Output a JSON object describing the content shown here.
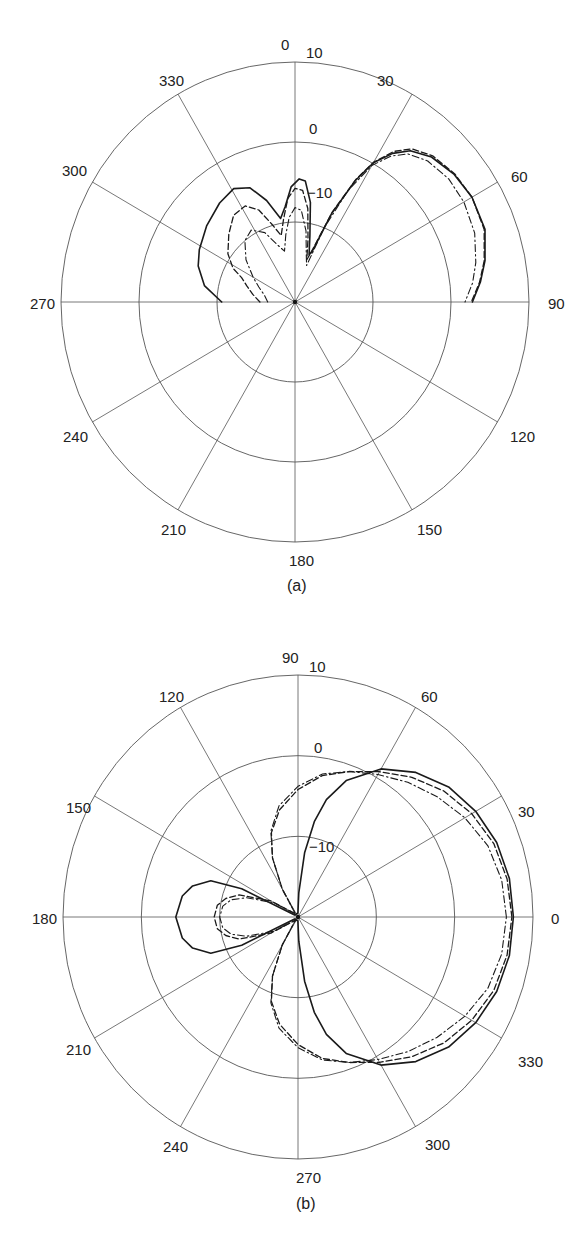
{
  "chart_data": [
    {
      "type": "polar",
      "panel": "a",
      "caption": "(a)",
      "center": [
        295,
        302
      ],
      "radius_px": [
        234,
        240
      ],
      "angle_zero": "top",
      "angle_direction": "clockwise",
      "angle_ticks": [
        0,
        30,
        60,
        90,
        120,
        150,
        180,
        210,
        240,
        270,
        300,
        330
      ],
      "angle_labels": [
        "0",
        "30",
        "60",
        "90",
        "120",
        "150",
        "180",
        "210",
        "240",
        "270",
        "300",
        "330"
      ],
      "radial_ticks_db": [
        -10,
        0,
        10
      ],
      "radial_labels": [
        "−10",
        "0",
        "10"
      ],
      "rlim_db": [
        -20,
        10
      ],
      "grid": true,
      "series": [
        {
          "name": "solid",
          "style": "solid",
          "points": [
            [
              270,
              -10.6
            ],
            [
              280,
              -8.2
            ],
            [
              290,
              -6.8
            ],
            [
              298,
              -6.1
            ],
            [
              310,
              -5.2
            ],
            [
              322,
              -4.3
            ],
            [
              331,
              -3.8
            ],
            [
              338,
              -4.6
            ],
            [
              344,
              -6.8
            ],
            [
              350,
              -9.4
            ],
            [
              354,
              -8
            ],
            [
              358,
              -5.6
            ],
            [
              2,
              -4.6
            ],
            [
              5,
              -4.8
            ],
            [
              9,
              -7.4
            ],
            [
              13,
              -11.5
            ],
            [
              17,
              -13.8
            ],
            [
              19,
              -13.4
            ],
            [
              23,
              -8
            ],
            [
              27,
              -3
            ],
            [
              30,
              0.1
            ],
            [
              34,
              2.4
            ],
            [
              38,
              4.0
            ],
            [
              44,
              5.2
            ],
            [
              52,
              5.9
            ],
            [
              60,
              6.2
            ],
            [
              69.5,
              6.0
            ],
            [
              78,
              4.9
            ],
            [
              84,
              3.9
            ],
            [
              90,
              2.75
            ]
          ]
        },
        {
          "name": "dashed",
          "style": "dashed",
          "points": [
            [
              270,
              -15.5
            ],
            [
              280,
              -14.5
            ],
            [
              288,
              -13.5
            ],
            [
              294,
              -12.5
            ],
            [
              298,
              -11
            ],
            [
              305,
              -9.5
            ],
            [
              315,
              -8
            ],
            [
              324,
              -6.6
            ],
            [
              332,
              -6.4
            ],
            [
              338,
              -7.6
            ],
            [
              343,
              -9.8
            ],
            [
              348,
              -11.5
            ],
            [
              352,
              -9.5
            ],
            [
              356,
              -7
            ],
            [
              0,
              -5.8
            ],
            [
              4,
              -6
            ],
            [
              8,
              -8.2
            ],
            [
              12,
              -12
            ],
            [
              16,
              -14.5
            ],
            [
              19,
              -13
            ],
            [
              23,
              -7.8
            ],
            [
              27,
              -2.8
            ],
            [
              30,
              0.2
            ],
            [
              34,
              2.7
            ],
            [
              38,
              4.3
            ],
            [
              44,
              5.4
            ],
            [
              52,
              6.0
            ],
            [
              60,
              6.2
            ],
            [
              69.5,
              5.9
            ],
            [
              78,
              4.8
            ],
            [
              84,
              3.8
            ],
            [
              90,
              2.6
            ]
          ]
        },
        {
          "name": "dash-dot",
          "style": "dashdot",
          "points": [
            [
              270,
              -16.5
            ],
            [
              282,
              -16
            ],
            [
              292,
              -15
            ],
            [
              300,
              -13.8
            ],
            [
              310,
              -11.8
            ],
            [
              320,
              -10
            ],
            [
              328,
              -9.4
            ],
            [
              336,
              -10.5
            ],
            [
              342,
              -12.4
            ],
            [
              348,
              -13.5
            ],
            [
              352,
              -11.5
            ],
            [
              356,
              -9.4
            ],
            [
              0,
              -8.2
            ],
            [
              4,
              -8.5
            ],
            [
              9,
              -11
            ],
            [
              14,
              -14
            ],
            [
              18,
              -15.2
            ],
            [
              22,
              -10
            ],
            [
              26,
              -4.5
            ],
            [
              30,
              -0.3
            ],
            [
              34,
              2.0
            ],
            [
              38,
              3.5
            ],
            [
              44,
              4.5
            ],
            [
              52,
              5.0
            ],
            [
              60,
              5.0
            ],
            [
              69.5,
              4.6
            ],
            [
              78,
              3.7
            ],
            [
              84,
              2.9
            ],
            [
              90,
              1.8
            ]
          ]
        }
      ]
    },
    {
      "type": "polar",
      "panel": "b",
      "caption": "(b)",
      "center": [
        298,
        917
      ],
      "radius_px": [
        235,
        242
      ],
      "angle_zero": "right",
      "angle_direction": "counterclockwise",
      "angle_ticks": [
        0,
        30,
        60,
        90,
        120,
        150,
        180,
        210,
        240,
        270,
        300,
        330
      ],
      "angle_labels": [
        "0",
        "30",
        "60",
        "90",
        "120",
        "150",
        "180",
        "210",
        "240",
        "270",
        "300",
        "330"
      ],
      "radial_ticks_db": [
        -10,
        0,
        10
      ],
      "radial_labels": [
        "−10",
        "0",
        "10"
      ],
      "rlim_db": [
        -20,
        10
      ],
      "grid": true,
      "series": [
        {
          "name": "solid",
          "style": "solid",
          "points": [
            [
              0,
              7.5
            ],
            [
              10,
              7.4
            ],
            [
              20,
              7.0
            ],
            [
              30,
              6.2
            ],
            [
              40,
              5.1
            ],
            [
              50,
              3.4
            ],
            [
              60,
              1.2
            ],
            [
              70,
              -2.0
            ],
            [
              76,
              -5.0
            ],
            [
              80,
              -8
            ],
            [
              84,
              -12
            ],
            [
              88,
              -17
            ],
            [
              92,
              -19.5
            ],
            [
              150,
              -19.5
            ],
            [
              154,
              -12
            ],
            [
              158,
              -8
            ],
            [
              164,
              -6
            ],
            [
              170,
              -5.0
            ],
            [
              180,
              -4.4
            ],
            [
              190,
              -5.0
            ],
            [
              196,
              -6
            ],
            [
              202,
              -8
            ],
            [
              206,
              -12
            ],
            [
              210,
              -19.5
            ],
            [
              268,
              -19.5
            ],
            [
              272,
              -17
            ],
            [
              276,
              -12
            ],
            [
              280,
              -8
            ],
            [
              284,
              -5.0
            ],
            [
              290,
              -2.0
            ],
            [
              300,
              1.2
            ],
            [
              310,
              3.4
            ],
            [
              320,
              5.1
            ],
            [
              330,
              6.2
            ],
            [
              340,
              7.0
            ],
            [
              350,
              7.4
            ],
            [
              360,
              7.5
            ]
          ]
        },
        {
          "name": "dashed",
          "style": "dashed",
          "points": [
            [
              0,
              7.3
            ],
            [
              10,
              7.1
            ],
            [
              20,
              6.6
            ],
            [
              30,
              5.6
            ],
            [
              40,
              4.3
            ],
            [
              50,
              2.6
            ],
            [
              60,
              0.8
            ],
            [
              70,
              -0.8
            ],
            [
              80,
              -2.2
            ],
            [
              90,
              -4.2
            ],
            [
              100,
              -6.5
            ],
            [
              108,
              -9
            ],
            [
              114,
              -12
            ],
            [
              120,
              -16
            ],
            [
              130,
              -19.5
            ],
            [
              150,
              -16
            ],
            [
              160,
              -12
            ],
            [
              166,
              -10.5
            ],
            [
              172,
              -9.6
            ],
            [
              180,
              -9.3
            ],
            [
              188,
              -9.6
            ],
            [
              194,
              -10.5
            ],
            [
              200,
              -12
            ],
            [
              210,
              -16
            ],
            [
              230,
              -19.5
            ],
            [
              240,
              -16
            ],
            [
              246,
              -12
            ],
            [
              252,
              -9
            ],
            [
              260,
              -6.5
            ],
            [
              270,
              -4.2
            ],
            [
              280,
              -2.2
            ],
            [
              290,
              -0.8
            ],
            [
              300,
              0.8
            ],
            [
              310,
              2.6
            ],
            [
              320,
              4.3
            ],
            [
              330,
              5.6
            ],
            [
              340,
              6.6
            ],
            [
              350,
              7.1
            ],
            [
              360,
              7.3
            ]
          ]
        },
        {
          "name": "dash-dot",
          "style": "dashdot",
          "points": [
            [
              0,
              6.6
            ],
            [
              10,
              6.4
            ],
            [
              20,
              5.8
            ],
            [
              30,
              4.6
            ],
            [
              40,
              3.2
            ],
            [
              50,
              1.8
            ],
            [
              60,
              0.4
            ],
            [
              70,
              -0.8
            ],
            [
              80,
              -2.0
            ],
            [
              90,
              -3.8
            ],
            [
              100,
              -6.0
            ],
            [
              108,
              -8.8
            ],
            [
              114,
              -12
            ],
            [
              120,
              -16
            ],
            [
              130,
              -19.5
            ],
            [
              150,
              -16.5
            ],
            [
              160,
              -13
            ],
            [
              166,
              -11.2
            ],
            [
              172,
              -10.3
            ],
            [
              180,
              -10.0
            ],
            [
              188,
              -10.3
            ],
            [
              194,
              -11.2
            ],
            [
              200,
              -13
            ],
            [
              210,
              -16.5
            ],
            [
              230,
              -19.5
            ],
            [
              240,
              -16
            ],
            [
              246,
              -12
            ],
            [
              252,
              -8.8
            ],
            [
              260,
              -6.0
            ],
            [
              270,
              -3.8
            ],
            [
              280,
              -2.0
            ],
            [
              290,
              -0.8
            ],
            [
              300,
              0.4
            ],
            [
              310,
              1.8
            ],
            [
              320,
              3.2
            ],
            [
              330,
              4.6
            ],
            [
              340,
              5.8
            ],
            [
              350,
              6.4
            ],
            [
              360,
              6.6
            ]
          ]
        }
      ]
    }
  ],
  "labels": {
    "a": {
      "angles": [
        {
          "text": "0",
          "x": 281,
          "y": 50
        },
        {
          "text": "30",
          "x": 377,
          "y": 86
        },
        {
          "text": "60",
          "x": 511,
          "y": 182
        },
        {
          "text": "90",
          "x": 548,
          "y": 309
        },
        {
          "text": "120",
          "x": 510,
          "y": 442
        },
        {
          "text": "150",
          "x": 417,
          "y": 535
        },
        {
          "text": "180",
          "x": 289,
          "y": 566
        },
        {
          "text": "210",
          "x": 161,
          "y": 535
        },
        {
          "text": "240",
          "x": 63,
          "y": 442
        },
        {
          "text": "270",
          "x": 30,
          "y": 309
        },
        {
          "text": "300",
          "x": 62,
          "y": 176
        },
        {
          "text": "330",
          "x": 159,
          "y": 86
        }
      ],
      "radial": [
        {
          "text": "10",
          "x": 306,
          "y": 58
        },
        {
          "text": "0",
          "x": 309,
          "y": 134
        },
        {
          "text": "−10",
          "x": 307,
          "y": 198
        }
      ],
      "caption": {
        "text": "(a)",
        "x": 287,
        "y": 591
      }
    },
    "b": {
      "angles": [
        {
          "text": "90",
          "x": 282,
          "y": 663
        },
        {
          "text": "60",
          "x": 421,
          "y": 702
        },
        {
          "text": "30",
          "x": 518,
          "y": 817
        },
        {
          "text": "0",
          "x": 551,
          "y": 924
        },
        {
          "text": "330",
          "x": 518,
          "y": 1067
        },
        {
          "text": "300",
          "x": 425,
          "y": 1150
        },
        {
          "text": "270",
          "x": 296,
          "y": 1183
        },
        {
          "text": "240",
          "x": 163,
          "y": 1152
        },
        {
          "text": "210",
          "x": 66,
          "y": 1055
        },
        {
          "text": "180",
          "x": 32,
          "y": 924
        },
        {
          "text": "150",
          "x": 66,
          "y": 813
        },
        {
          "text": "120",
          "x": 159,
          "y": 702
        }
      ],
      "radial": [
        {
          "text": "10",
          "x": 309,
          "y": 672
        },
        {
          "text": "0",
          "x": 314,
          "y": 753
        },
        {
          "text": "−10",
          "x": 309,
          "y": 852
        }
      ],
      "caption": {
        "text": "(b)",
        "x": 296,
        "y": 1209
      }
    }
  }
}
